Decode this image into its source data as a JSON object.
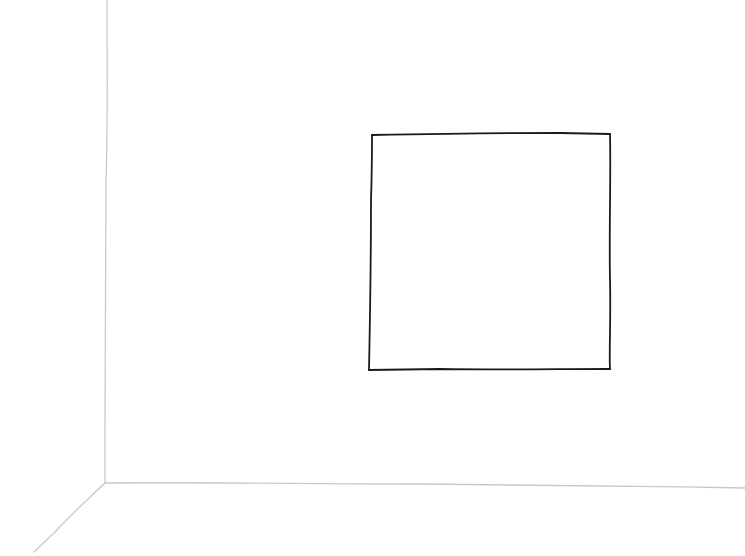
{
  "scene": {
    "description": "Hand-drawn pencil/ink sketch of a room corner with a square frame on the wall",
    "background_color": "#ffffff",
    "room_lines_color": "#c8c8c8",
    "frame_color": "#1a1a1a",
    "room_lines": {
      "wall_vertical_edge": [
        [
          107,
          0
        ],
        [
          105,
          483
        ]
      ],
      "floor_wall_edge": [
        [
          105,
          483
        ],
        [
          745,
          488
        ]
      ],
      "floor_diagonal": [
        [
          105,
          483
        ],
        [
          34,
          552
        ]
      ]
    },
    "frame": {
      "x1": 372,
      "y1": 134,
      "x2": 610,
      "y2": 369
    }
  }
}
